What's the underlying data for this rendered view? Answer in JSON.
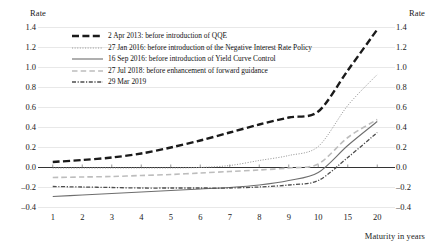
{
  "chart_data": {
    "type": "line",
    "title": "",
    "subtitle": "",
    "xlabel": "Maturity in years",
    "ylabel": "Rate",
    "ylabel_right": "Rate",
    "categories": [
      "1",
      "2",
      "3",
      "4",
      "5",
      "6",
      "7",
      "8",
      "9",
      "10",
      "15",
      "20"
    ],
    "x_tick_labels": [
      "1",
      "2",
      "3",
      "4",
      "5",
      "6",
      "7",
      "8",
      "9",
      "10",
      "15",
      "20"
    ],
    "y_tick_labels": [
      "1.4",
      "1.2",
      "1.0",
      "0.8",
      "0.6",
      "0.4",
      "0.2",
      "0.0",
      "-0.2",
      "-0.4"
    ],
    "y_tick_values": [
      1.4,
      1.2,
      1.0,
      0.8,
      0.6,
      0.4,
      0.2,
      0.0,
      -0.2,
      -0.4
    ],
    "ylim": [
      -0.4,
      1.4
    ],
    "grid": true,
    "legend_position": "upper-left-inside",
    "series": [
      {
        "name": "2 Apr 2013: before introduction of QQE",
        "style": "thick-dash",
        "color": "#1a1a1a",
        "width": 2.4,
        "values": [
          0.055,
          0.075,
          0.1,
          0.14,
          0.2,
          0.27,
          0.35,
          0.43,
          0.5,
          0.56,
          0.97,
          1.38
        ]
      },
      {
        "name": "27 Jan 2016: before introduction of the Negative Interest Rate Policy",
        "style": "dotted",
        "color": "#9a9a9a",
        "width": 1.0,
        "values": [
          -0.005,
          -0.005,
          -0.005,
          -0.005,
          -0.005,
          0.0,
          0.02,
          0.07,
          0.12,
          0.21,
          0.62,
          0.93
        ]
      },
      {
        "name": "16 Sep 2016: before introduction of Yield Curve Control",
        "style": "solid",
        "color": "#6e6e6e",
        "width": 1.1,
        "values": [
          -0.29,
          -0.275,
          -0.26,
          -0.245,
          -0.23,
          -0.215,
          -0.2,
          -0.175,
          -0.13,
          -0.05,
          0.22,
          0.46
        ]
      },
      {
        "name": "27 Jul 2018: before enhancement of forward guidance",
        "style": "long-dash",
        "color": "#bdbdbd",
        "width": 1.6,
        "values": [
          -0.1,
          -0.095,
          -0.09,
          -0.08,
          -0.07,
          -0.055,
          -0.04,
          -0.025,
          -0.005,
          0.035,
          0.3,
          0.48
        ]
      },
      {
        "name": "29 Mar 2019",
        "style": "dash-dot",
        "color": "#4d4d4d",
        "width": 1.3,
        "values": [
          -0.19,
          -0.195,
          -0.2,
          -0.205,
          -0.205,
          -0.205,
          -0.205,
          -0.195,
          -0.175,
          -0.13,
          0.1,
          0.35
        ]
      }
    ],
    "zero_line": 0.0,
    "zero_line_color": "#333333"
  },
  "axes": {
    "left_title": "Rate",
    "right_title": "Rate",
    "x_title": "Maturity in years"
  }
}
